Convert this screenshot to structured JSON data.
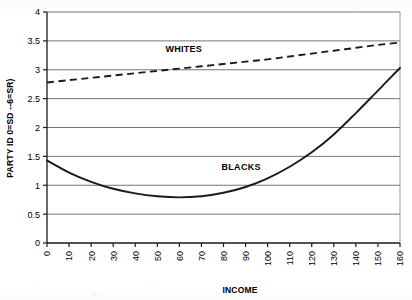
{
  "chart_data": {
    "type": "line",
    "title": "",
    "xlabel": "INCOME",
    "ylabel": "PARTY ID 0=SD --6=SR)",
    "xlim": [
      0,
      160
    ],
    "ylim": [
      0,
      4
    ],
    "xticks": [
      "0",
      "10",
      "20",
      "30",
      "40",
      "50",
      "60",
      "70",
      "80",
      "90",
      "100",
      "110",
      "120",
      "130",
      "140",
      "150",
      "160"
    ],
    "yticks": [
      "0",
      "0.5",
      "1",
      "1.5",
      "2",
      "2.5",
      "3",
      "3.5",
      "4"
    ],
    "grid": "horizontal",
    "legend_position": "inline-annotations",
    "x": [
      0,
      10,
      20,
      30,
      40,
      50,
      60,
      70,
      80,
      90,
      100,
      110,
      120,
      130,
      140,
      150,
      160
    ],
    "series": [
      {
        "name": "WHITES",
        "style": "dashed",
        "values": [
          2.78,
          2.82,
          2.86,
          2.9,
          2.94,
          2.98,
          3.02,
          3.06,
          3.1,
          3.14,
          3.18,
          3.23,
          3.28,
          3.33,
          3.38,
          3.43,
          3.47
        ]
      },
      {
        "name": "BLACKS",
        "style": "solid",
        "values": [
          1.43,
          1.22,
          1.06,
          0.94,
          0.86,
          0.81,
          0.79,
          0.81,
          0.87,
          0.97,
          1.12,
          1.32,
          1.57,
          1.88,
          2.25,
          2.64,
          3.03
        ]
      }
    ],
    "annotations": [
      {
        "text": "WHITES",
        "x": 62,
        "y": 3.3
      },
      {
        "text": "BLACKS",
        "x": 88,
        "y": 1.27
      }
    ]
  },
  "colors": {
    "ink": "#1a1a1a",
    "gridline": "#6e6e6e",
    "axis": "#1a1a1a",
    "background": "#ffffff"
  }
}
